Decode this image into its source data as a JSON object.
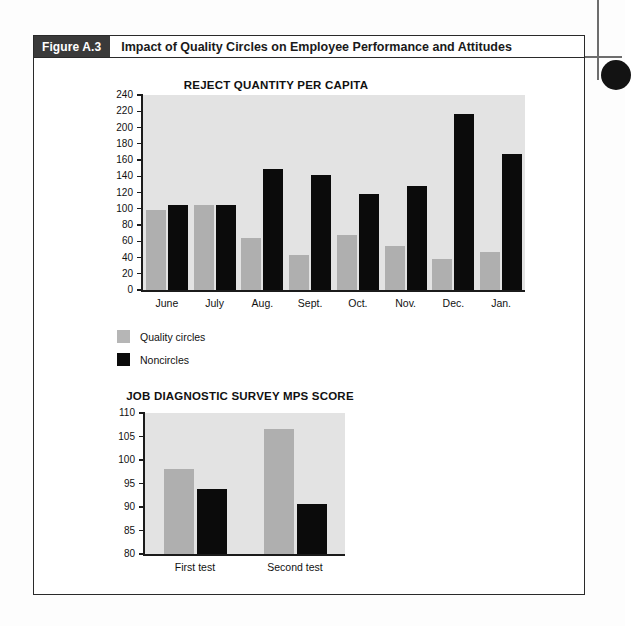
{
  "caption": {
    "figure_number": "Figure A.3",
    "title": "Impact of Quality Circles on Employee Performance and Attitudes"
  },
  "legend": {
    "items": [
      {
        "label": "Quality circles",
        "color": "#b6b6b6",
        "key": "quality"
      },
      {
        "label": "Noncircles",
        "color": "#0b0b0b",
        "key": "noncircle"
      }
    ]
  },
  "chart_data": [
    {
      "type": "bar",
      "title": "REJECT QUANTITY PER CAPITA",
      "xlabel": "",
      "ylabel": "",
      "ylim": [
        0,
        240
      ],
      "ytick_step": 20,
      "yticks": [
        "0",
        "20",
        "40",
        "60",
        "80",
        "100",
        "120",
        "140",
        "160",
        "180",
        "200",
        "220",
        "240"
      ],
      "grid": false,
      "legend_position": "below-left",
      "categories": [
        "June",
        "July",
        "Aug.",
        "Sept.",
        "Oct.",
        "Nov.",
        "Dec.",
        "Jan."
      ],
      "series": [
        {
          "name": "Quality circles",
          "color": "#afafaf",
          "values": [
            98,
            105,
            64,
            43,
            68,
            54,
            38,
            47
          ]
        },
        {
          "name": "Noncircles",
          "color": "#0b0b0b",
          "values": [
            105,
            105,
            149,
            141,
            118,
            128,
            217,
            167
          ]
        }
      ]
    },
    {
      "type": "bar",
      "title": "JOB DIAGNOSTIC SURVEY MPS SCORE",
      "xlabel": "",
      "ylabel": "",
      "ylim": [
        80,
        110
      ],
      "ytick_step": 5,
      "yticks": [
        "80",
        "85",
        "90",
        "95",
        "100",
        "105",
        "110"
      ],
      "grid": false,
      "legend_position": "none",
      "categories": [
        "First test",
        "Second test"
      ],
      "series": [
        {
          "name": "Quality circles",
          "color": "#afafaf",
          "values": [
            98,
            106.5
          ]
        },
        {
          "name": "Noncircles",
          "color": "#0b0b0b",
          "values": [
            93.8,
            90.7
          ]
        }
      ]
    }
  ]
}
